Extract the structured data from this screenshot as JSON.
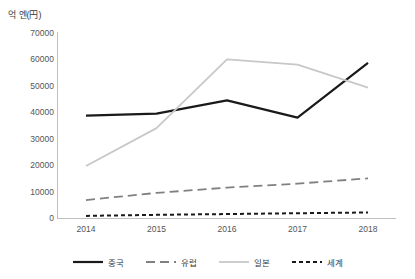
{
  "chart_data": {
    "type": "line",
    "title": "",
    "subtitle": "",
    "xlabel": "",
    "ylabel": "억 엔(円)",
    "categories": [
      "2014",
      "2015",
      "2016",
      "2017",
      "2018"
    ],
    "x": [
      2014,
      2015,
      2016,
      2017,
      2018
    ],
    "ylim": [
      0,
      70000
    ],
    "y_ticks": [
      0,
      10000,
      20000,
      30000,
      40000,
      50000,
      60000,
      70000
    ],
    "y_tick_labels": [
      "0",
      "10000",
      "20000",
      "30000",
      "40000",
      "50000",
      "60000",
      "70000"
    ],
    "grid": false,
    "legend_position": "bottom",
    "series": [
      {
        "name": "중국",
        "values": [
          38700,
          39500,
          44500,
          38000,
          58700
        ],
        "color": "#1a1a1a",
        "style": "solid",
        "width": 2.2
      },
      {
        "name": "유럽",
        "values": [
          6800,
          9500,
          11500,
          13000,
          15000
        ],
        "color": "#808080",
        "style": "dashed",
        "width": 1.8
      },
      {
        "name": "일본",
        "values": [
          19700,
          34000,
          60000,
          58000,
          49300
        ],
        "color": "#c8c8c8",
        "style": "solid",
        "width": 1.8
      },
      {
        "name": "세계",
        "values": [
          800,
          1200,
          1500,
          1800,
          2100
        ],
        "color": "#1a1a1a",
        "style": "dotted",
        "width": 2.0
      }
    ]
  },
  "axis": {
    "y_title": "억 엔(円)"
  },
  "legend": {
    "items": [
      {
        "label": "중국"
      },
      {
        "label": "유럽"
      },
      {
        "label": "일본"
      },
      {
        "label": "세계"
      }
    ]
  }
}
